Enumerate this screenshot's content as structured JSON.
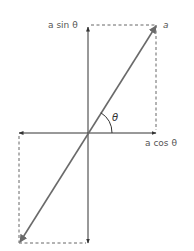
{
  "diagram": {
    "type": "vector-components",
    "labels": {
      "vector": "a",
      "y_component": "a sin θ",
      "x_component": "a cos θ",
      "angle": "θ"
    },
    "colors": {
      "axis": "#333333",
      "vector": "#6a6a6a",
      "dashed": "#666666",
      "text": "#555555"
    },
    "geometry": {
      "origin": [
        88,
        133
      ],
      "vector_head": [
        156,
        26
      ],
      "vector_tail": [
        20,
        242
      ],
      "axis_h": [
        19,
        156
      ],
      "axis_v": [
        26,
        243
      ]
    }
  }
}
